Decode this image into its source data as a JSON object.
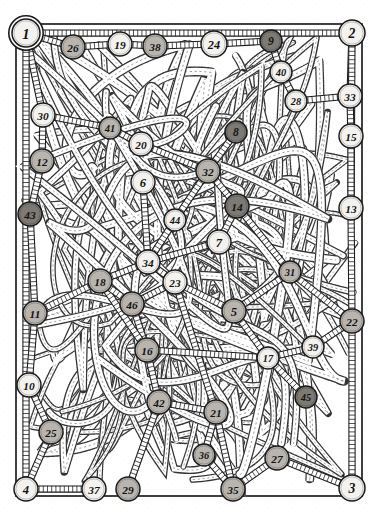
{
  "page": {
    "caption": "THE NETWORK",
    "width": 378,
    "height": 519
  },
  "style": {
    "paper": "#fdfdfc",
    "ink": "#1a1a1a",
    "node_light": "#f4f2ee",
    "node_mid": "#b9b5ae",
    "node_dark": "#7d7a74",
    "border": "#111111"
  },
  "frame": {
    "x": 16,
    "y": 24,
    "width": 346,
    "height": 472,
    "label": "puzzle-border"
  },
  "chart_data": {
    "type": "diagram",
    "node_count": 46,
    "shade_legend": {
      "light": "pale cream fill",
      "mid": "medium grey fill",
      "dark": "dark grey fill"
    },
    "nodes": [
      {
        "id": 1,
        "label": "1",
        "x": 26,
        "y": 33,
        "r": 14,
        "shade": "light",
        "ornate": true
      },
      {
        "id": 2,
        "label": "2",
        "x": 352,
        "y": 33,
        "r": 13,
        "shade": "light"
      },
      {
        "id": 3,
        "label": "3",
        "x": 352,
        "y": 488,
        "r": 13,
        "shade": "light"
      },
      {
        "id": 4,
        "label": "4",
        "x": 26,
        "y": 489,
        "r": 12,
        "shade": "light"
      },
      {
        "id": 26,
        "label": "26",
        "x": 73,
        "y": 47,
        "r": 12,
        "shade": "mid"
      },
      {
        "id": 19,
        "label": "19",
        "x": 120,
        "y": 44,
        "r": 12,
        "shade": "light"
      },
      {
        "id": 38,
        "label": "38",
        "x": 155,
        "y": 46,
        "r": 12,
        "shade": "mid"
      },
      {
        "id": 24,
        "label": "24",
        "x": 214,
        "y": 44,
        "r": 13,
        "shade": "light"
      },
      {
        "id": 9,
        "label": "9",
        "x": 271,
        "y": 41,
        "r": 11,
        "shade": "dark"
      },
      {
        "id": 40,
        "label": "40",
        "x": 281,
        "y": 72,
        "r": 11,
        "shade": "light"
      },
      {
        "id": 28,
        "label": "28",
        "x": 296,
        "y": 101,
        "r": 11,
        "shade": "light"
      },
      {
        "id": 33,
        "label": "33",
        "x": 350,
        "y": 96,
        "r": 12,
        "shade": "light"
      },
      {
        "id": 15,
        "label": "15",
        "x": 351,
        "y": 136,
        "r": 12,
        "shade": "light"
      },
      {
        "id": 13,
        "label": "13",
        "x": 351,
        "y": 208,
        "r": 12,
        "shade": "light"
      },
      {
        "id": 30,
        "label": "30",
        "x": 43,
        "y": 115,
        "r": 12,
        "shade": "light"
      },
      {
        "id": 41,
        "label": "41",
        "x": 110,
        "y": 128,
        "r": 11,
        "shade": "mid"
      },
      {
        "id": 20,
        "label": "20",
        "x": 141,
        "y": 144,
        "r": 12,
        "shade": "light"
      },
      {
        "id": 8,
        "label": "8",
        "x": 236,
        "y": 132,
        "r": 11,
        "shade": "dark"
      },
      {
        "id": 32,
        "label": "32",
        "x": 208,
        "y": 171,
        "r": 12,
        "shade": "mid"
      },
      {
        "id": 12,
        "label": "12",
        "x": 42,
        "y": 161,
        "r": 12,
        "shade": "mid"
      },
      {
        "id": 6,
        "label": "6",
        "x": 143,
        "y": 182,
        "r": 12,
        "shade": "light"
      },
      {
        "id": 43,
        "label": "43",
        "x": 30,
        "y": 214,
        "r": 12,
        "shade": "dark"
      },
      {
        "id": 14,
        "label": "14",
        "x": 237,
        "y": 206,
        "r": 12,
        "shade": "dark"
      },
      {
        "id": 44,
        "label": "44",
        "x": 175,
        "y": 220,
        "r": 11,
        "shade": "light"
      },
      {
        "id": 7,
        "label": "7",
        "x": 219,
        "y": 242,
        "r": 12,
        "shade": "light"
      },
      {
        "id": 34,
        "label": "34",
        "x": 148,
        "y": 262,
        "r": 12,
        "shade": "light"
      },
      {
        "id": 31,
        "label": "31",
        "x": 290,
        "y": 272,
        "r": 11,
        "shade": "mid"
      },
      {
        "id": 18,
        "label": "18",
        "x": 100,
        "y": 281,
        "r": 12,
        "shade": "mid"
      },
      {
        "id": 23,
        "label": "23",
        "x": 175,
        "y": 282,
        "r": 12,
        "shade": "light"
      },
      {
        "id": 46,
        "label": "46",
        "x": 132,
        "y": 304,
        "r": 12,
        "shade": "mid"
      },
      {
        "id": 11,
        "label": "11",
        "x": 35,
        "y": 313,
        "r": 12,
        "shade": "mid"
      },
      {
        "id": 5,
        "label": "5",
        "x": 234,
        "y": 311,
        "r": 12,
        "shade": "mid"
      },
      {
        "id": 22,
        "label": "22",
        "x": 352,
        "y": 321,
        "r": 12,
        "shade": "mid"
      },
      {
        "id": 16,
        "label": "16",
        "x": 147,
        "y": 350,
        "r": 12,
        "shade": "mid"
      },
      {
        "id": 17,
        "label": "17",
        "x": 268,
        "y": 358,
        "r": 11,
        "shade": "light"
      },
      {
        "id": 39,
        "label": "39",
        "x": 313,
        "y": 347,
        "r": 11,
        "shade": "light"
      },
      {
        "id": 10,
        "label": "10",
        "x": 29,
        "y": 385,
        "r": 12,
        "shade": "light"
      },
      {
        "id": 42,
        "label": "42",
        "x": 159,
        "y": 402,
        "r": 12,
        "shade": "mid"
      },
      {
        "id": 45,
        "label": "45",
        "x": 306,
        "y": 397,
        "r": 11,
        "shade": "dark"
      },
      {
        "id": 21,
        "label": "21",
        "x": 216,
        "y": 412,
        "r": 12,
        "shade": "mid"
      },
      {
        "id": 25,
        "label": "25",
        "x": 51,
        "y": 432,
        "r": 12,
        "shade": "mid"
      },
      {
        "id": 27,
        "label": "27",
        "x": 277,
        "y": 458,
        "r": 12,
        "shade": "mid"
      },
      {
        "id": 36,
        "label": "36",
        "x": 204,
        "y": 455,
        "r": 11,
        "shade": "mid"
      },
      {
        "id": 37,
        "label": "37",
        "x": 94,
        "y": 489,
        "r": 12,
        "shade": "light"
      },
      {
        "id": 29,
        "label": "29",
        "x": 128,
        "y": 489,
        "r": 12,
        "shade": "mid"
      },
      {
        "id": 35,
        "label": "35",
        "x": 233,
        "y": 489,
        "r": 12,
        "shade": "mid"
      }
    ],
    "ladder_edges": [
      [
        1,
        2
      ],
      [
        1,
        30
      ],
      [
        1,
        4
      ],
      [
        2,
        33
      ],
      [
        2,
        13
      ],
      [
        26,
        19
      ],
      [
        19,
        38
      ],
      [
        38,
        24
      ],
      [
        24,
        9
      ],
      [
        9,
        40
      ],
      [
        40,
        28
      ],
      [
        28,
        33
      ],
      [
        30,
        41
      ],
      [
        41,
        20
      ],
      [
        20,
        32
      ],
      [
        32,
        8
      ],
      [
        32,
        14
      ],
      [
        14,
        7
      ],
      [
        12,
        43
      ],
      [
        43,
        11
      ],
      [
        11,
        10
      ],
      [
        10,
        25
      ],
      [
        25,
        4
      ],
      [
        4,
        37
      ],
      [
        6,
        34
      ],
      [
        34,
        23
      ],
      [
        34,
        18
      ],
      [
        34,
        44
      ],
      [
        44,
        32
      ],
      [
        23,
        46
      ],
      [
        46,
        16
      ],
      [
        16,
        42
      ],
      [
        42,
        29
      ],
      [
        23,
        21
      ],
      [
        21,
        35
      ],
      [
        5,
        17
      ],
      [
        17,
        39
      ],
      [
        39,
        22
      ],
      [
        22,
        13
      ],
      [
        31,
        5
      ],
      [
        31,
        22
      ],
      [
        18,
        11
      ],
      [
        16,
        18
      ],
      [
        16,
        17
      ],
      [
        7,
        34
      ],
      [
        36,
        35
      ],
      [
        27,
        3
      ],
      [
        35,
        27
      ],
      [
        3,
        22
      ],
      [
        45,
        17
      ],
      [
        42,
        21
      ],
      [
        21,
        36
      ],
      [
        13,
        15
      ],
      [
        15,
        33
      ],
      [
        46,
        18
      ],
      [
        5,
        23
      ],
      [
        31,
        14
      ],
      [
        12,
        30
      ],
      [
        26,
        1
      ]
    ],
    "rope_curves": 34
  }
}
